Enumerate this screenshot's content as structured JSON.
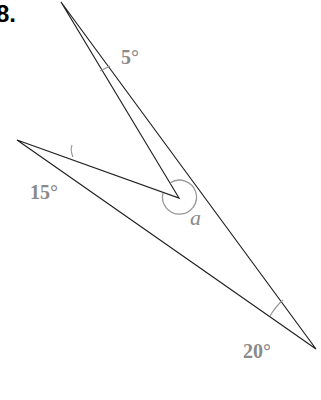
{
  "problem_number": "8.",
  "angles": {
    "top": "5°",
    "left": "15°",
    "bottom_right": "20°",
    "unknown": "a"
  },
  "colors": {
    "line": "#222222",
    "label": "#8a8a8a"
  }
}
